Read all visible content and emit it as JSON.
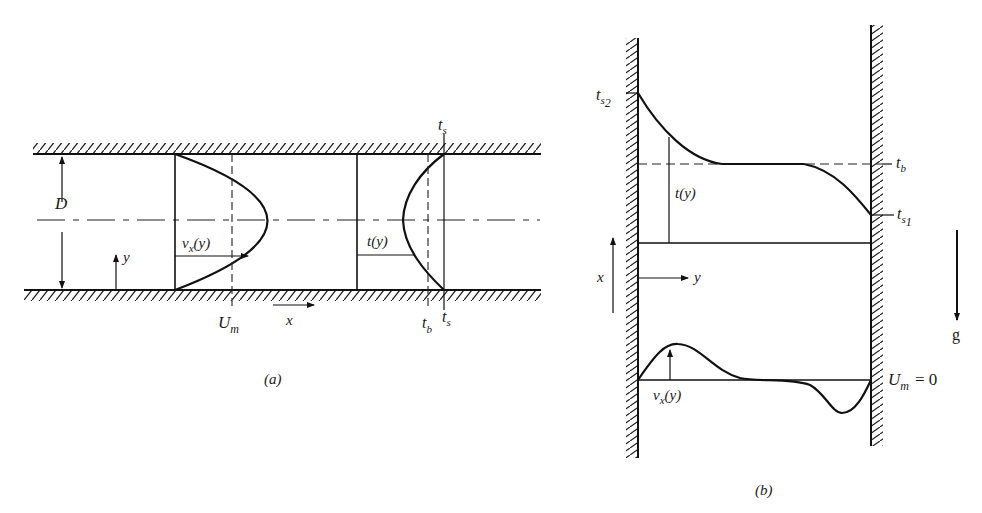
{
  "figure_a": {
    "caption": "(a)",
    "labels": {
      "diameter": "D",
      "y_axis": "y",
      "x_axis": "x",
      "velocity_profile": "vx(y)",
      "velocity_profile_main": "v",
      "velocity_profile_sub": "x",
      "velocity_profile_arg": "(y)",
      "mean_velocity_main": "U",
      "mean_velocity_sub": "m",
      "temperature_profile": "t(y)",
      "bulk_temp_main": "t",
      "bulk_temp_sub": "b",
      "surface_temp_main": "t",
      "surface_temp_sub": "s"
    }
  },
  "figure_b": {
    "caption": "(b)",
    "labels": {
      "ts2_main": "t",
      "ts2_sub": "s",
      "ts2_subsub": "2",
      "tb_main": "t",
      "tb_sub": "b",
      "ts1_main": "t",
      "ts1_sub": "s",
      "ts1_subsub": "1",
      "temperature_profile": "t(y)",
      "x_axis": "x",
      "y_axis": "y",
      "gravity": "g",
      "velocity_profile_main": "v",
      "velocity_profile_sub": "x",
      "velocity_profile_arg": "(y)",
      "mean_velocity_main": "U",
      "mean_velocity_sub": "m",
      "mean_velocity_value": "= 0"
    }
  }
}
